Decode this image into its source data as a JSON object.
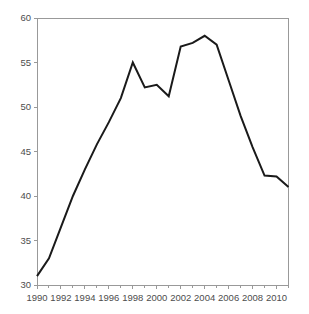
{
  "chart_data": {
    "type": "line",
    "title": "",
    "subtitle": "",
    "xlabel": "",
    "ylabel": "",
    "xlim": [
      1990,
      2011
    ],
    "ylim": [
      30,
      60
    ],
    "xticks": [
      1990,
      1992,
      1994,
      1996,
      1998,
      2000,
      2002,
      2004,
      2006,
      2008,
      2010
    ],
    "yticks": [
      30,
      35,
      40,
      45,
      50,
      55,
      60
    ],
    "xtick_labels": [
      "1990",
      "1992",
      "1994",
      "1996",
      "1998",
      "2000",
      "2002",
      "2004",
      "2006",
      "2008",
      "2010"
    ],
    "ytick_labels": [
      "30",
      "35",
      "40",
      "45",
      "50",
      "55",
      "60"
    ],
    "grid": false,
    "legend": false,
    "legend_position": "none",
    "minor_xticks": true,
    "line_color": "#1a1a1a",
    "line_width": 2,
    "axis_color": "#999999",
    "background_color": "#ffffff",
    "x": [
      1990,
      1991,
      1992,
      1993,
      1994,
      1995,
      1996,
      1997,
      1998,
      1999,
      2000,
      2001,
      2002,
      2003,
      2004,
      2005,
      2006,
      2007,
      2008,
      2009,
      2010,
      2011
    ],
    "series": [
      {
        "name": "",
        "values": [
          31.0,
          33.0,
          36.5,
          40.0,
          43.0,
          45.8,
          48.3,
          51.0,
          55.0,
          52.2,
          52.5,
          51.2,
          56.8,
          57.2,
          58.0,
          57.0,
          53.0,
          49.0,
          45.5,
          42.3,
          42.2,
          41.0
        ]
      }
    ]
  }
}
